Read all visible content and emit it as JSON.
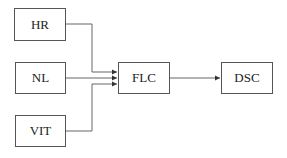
{
  "diagram": {
    "inputs": [
      {
        "id": "hr",
        "label": "HR"
      },
      {
        "id": "nl",
        "label": "NL"
      },
      {
        "id": "vit",
        "label": "VIT"
      }
    ],
    "controller": {
      "id": "flc",
      "label": "FLC"
    },
    "output": {
      "id": "dsc",
      "label": "DSC"
    },
    "edges": [
      {
        "from": "HR",
        "to": "FLC"
      },
      {
        "from": "NL",
        "to": "FLC"
      },
      {
        "from": "VIT",
        "to": "FLC"
      },
      {
        "from": "FLC",
        "to": "DSC"
      }
    ],
    "colors": {
      "line": "#555555",
      "text": "#222222",
      "background": "#ffffff"
    }
  }
}
